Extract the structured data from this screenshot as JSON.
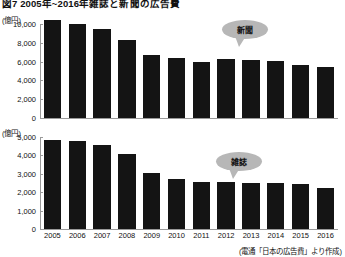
{
  "title": "図7 2005年~2016年雑誌と新聞の広告費",
  "source_note": "(電通「日本の広告費」より作成)",
  "callouts": {
    "top": "新聞",
    "bottom": "雑誌"
  },
  "units": {
    "top": "(億円)",
    "bottom": "(億円)"
  },
  "chart_data": [
    {
      "type": "bar",
      "title": "新聞の広告費",
      "xlabel": "",
      "ylabel": "(億円)",
      "ylim": [
        0,
        10000
      ],
      "yticks": [
        "0",
        "2,000",
        "4,000",
        "6,000",
        "8,000",
        "10,000"
      ],
      "ytick_values": [
        0,
        2000,
        4000,
        6000,
        8000,
        10000
      ],
      "grid": false,
      "legend": "none",
      "categories": [
        "2005",
        "2006",
        "2007",
        "2008",
        "2009",
        "2010",
        "2011",
        "2012",
        "2013",
        "2014",
        "2015",
        "2016"
      ],
      "values": [
        10377,
        9986,
        9462,
        8276,
        6739,
        6396,
        5990,
        6242,
        6170,
        6057,
        5679,
        5431
      ]
    },
    {
      "type": "bar",
      "title": "雑誌の広告費",
      "xlabel": "",
      "ylabel": "(億円)",
      "ylim": [
        0,
        5000
      ],
      "yticks": [
        "0",
        "1,000",
        "2,000",
        "3,000",
        "4,000",
        "5,000"
      ],
      "ytick_values": [
        0,
        1000,
        2000,
        3000,
        4000,
        5000
      ],
      "grid": false,
      "legend": "none",
      "categories": [
        "2005",
        "2006",
        "2007",
        "2008",
        "2009",
        "2010",
        "2011",
        "2012",
        "2013",
        "2014",
        "2015",
        "2016"
      ],
      "values": [
        4842,
        4777,
        4585,
        4078,
        3034,
        2733,
        2542,
        2551,
        2499,
        2500,
        2443,
        2223
      ]
    }
  ],
  "colors": {
    "bar": "#141414",
    "axis": "#9a9a9a",
    "callout": "#b7b7b7",
    "text": "#111111"
  }
}
